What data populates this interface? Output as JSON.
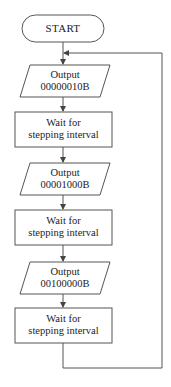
{
  "diagram": {
    "type": "flowchart",
    "line_color": "#555555",
    "start": {
      "label": "START"
    },
    "steps": [
      {
        "shape": "parallelogram",
        "line1": "Output",
        "line2": "00000010B"
      },
      {
        "shape": "rectangle",
        "line1": "Wait for",
        "line2": "stepping interval"
      },
      {
        "shape": "parallelogram",
        "line1": "Output",
        "line2": "00001000B"
      },
      {
        "shape": "rectangle",
        "line1": "Wait for",
        "line2": "stepping interval"
      },
      {
        "shape": "parallelogram",
        "line1": "Output",
        "line2": "00100000B"
      },
      {
        "shape": "rectangle",
        "line1": "Wait for",
        "line2": "stepping interval"
      }
    ],
    "loop": {
      "from": "last-wait",
      "to": "first-output"
    }
  }
}
